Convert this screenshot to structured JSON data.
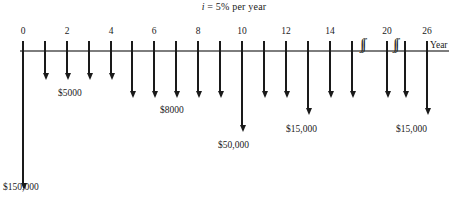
{
  "diagram": {
    "title_prefix": "i",
    "title_rest": " = 5% per year",
    "axis_label": "Year",
    "axis": {
      "x_start": 20,
      "x_end": 449,
      "y": 50,
      "tick_len_up": 9,
      "tick_len_down": 0
    },
    "ticks": [
      {
        "year": 0,
        "x": 22,
        "label": "0"
      },
      {
        "year": 1,
        "x": 44,
        "label": ""
      },
      {
        "year": 2,
        "x": 66,
        "label": "2"
      },
      {
        "year": 3,
        "x": 88,
        "label": ""
      },
      {
        "year": 4,
        "x": 110,
        "label": "4"
      },
      {
        "year": 5,
        "x": 131,
        "label": ""
      },
      {
        "year": 6,
        "x": 153,
        "label": "6"
      },
      {
        "year": 7,
        "x": 175,
        "label": ""
      },
      {
        "year": 8,
        "x": 197,
        "label": "8"
      },
      {
        "year": 9,
        "x": 219,
        "label": ""
      },
      {
        "year": 10,
        "x": 241,
        "label": "10"
      },
      {
        "year": 11,
        "x": 263,
        "label": ""
      },
      {
        "year": 12,
        "x": 285,
        "label": "12"
      },
      {
        "year": 13,
        "x": 307,
        "label": ""
      },
      {
        "year": 14,
        "x": 329,
        "label": "14"
      },
      {
        "year": 15,
        "x": 351,
        "label": ""
      },
      {
        "year": 20,
        "x": 386,
        "label": "20"
      },
      {
        "year": 25,
        "x": 404,
        "label": ""
      },
      {
        "year": 26,
        "x": 426,
        "label": "26"
      }
    ],
    "breaks": [
      {
        "x": 360,
        "glyph": "∫∫"
      },
      {
        "x": 393,
        "glyph": "∫∫"
      }
    ],
    "cashflows": [
      {
        "year": 0,
        "x": 22,
        "amount": "$150,000",
        "length": 140,
        "has_label": true,
        "label_x": 3,
        "label_y": 182
      },
      {
        "year": 1,
        "x": 44,
        "amount": "$5000",
        "length": 30,
        "has_label": false
      },
      {
        "year": 2,
        "x": 66,
        "amount": "$5000",
        "length": 30,
        "has_label": true,
        "label_x": 58,
        "label_y": 88
      },
      {
        "year": 3,
        "x": 88,
        "amount": "$5000",
        "length": 30,
        "has_label": false
      },
      {
        "year": 4,
        "x": 110,
        "amount": "$5000",
        "length": 30,
        "has_label": false
      },
      {
        "year": 5,
        "x": 131,
        "amount": "$8000",
        "length": 48,
        "has_label": false
      },
      {
        "year": 6,
        "x": 153,
        "amount": "$8000",
        "length": 48,
        "has_label": false
      },
      {
        "year": 7,
        "x": 175,
        "amount": "$8000",
        "length": 48,
        "has_label": true,
        "label_x": 160,
        "label_y": 105
      },
      {
        "year": 8,
        "x": 197,
        "amount": "$8000",
        "length": 48,
        "has_label": false
      },
      {
        "year": 9,
        "x": 219,
        "amount": "$8000",
        "length": 48,
        "has_label": false
      },
      {
        "year": 10,
        "x": 241,
        "amount": "$50,000",
        "length": 82,
        "has_label": true,
        "label_x": 218,
        "label_y": 140
      },
      {
        "year": 11,
        "x": 263,
        "amount": "$8000",
        "length": 48,
        "has_label": false
      },
      {
        "year": 12,
        "x": 285,
        "amount": "$8000",
        "length": 48,
        "has_label": false
      },
      {
        "year": 13,
        "x": 307,
        "amount": "$15,000",
        "length": 65,
        "has_label": true,
        "label_x": 286,
        "label_y": 124
      },
      {
        "year": 14,
        "x": 329,
        "amount": "$8000",
        "length": 48,
        "has_label": false
      },
      {
        "year": 15,
        "x": 351,
        "amount": "$8000",
        "length": 48,
        "has_label": false
      },
      {
        "year": 20,
        "x": 386,
        "amount": "$8000",
        "length": 48,
        "has_label": false
      },
      {
        "year": 25,
        "x": 404,
        "amount": "$8000",
        "length": 48,
        "has_label": false
      },
      {
        "year": 26,
        "x": 426,
        "amount": "$15,000",
        "length": 65,
        "has_label": true,
        "label_x": 396,
        "label_y": 124
      }
    ]
  },
  "chart_data": {
    "type": "bar",
    "title": "i = 5% per year",
    "xlabel": "Year",
    "ylabel": "Cash flow (outflow, $)",
    "categories": [
      0,
      1,
      2,
      3,
      4,
      5,
      6,
      7,
      8,
      9,
      10,
      11,
      12,
      13,
      14,
      15,
      20,
      25,
      26
    ],
    "values": [
      -150000,
      -5000,
      -5000,
      -5000,
      -5000,
      -8000,
      -8000,
      -8000,
      -8000,
      -8000,
      -50000,
      -8000,
      -8000,
      -15000,
      -8000,
      -8000,
      -8000,
      -8000,
      -15000
    ],
    "annotations": [
      "$150,000",
      "$5000",
      "$8000",
      "$50,000",
      "$15,000",
      "$15,000"
    ],
    "interest_rate": "5% per year",
    "axis_break_after_year": 15,
    "grid": false,
    "legend": "none"
  }
}
